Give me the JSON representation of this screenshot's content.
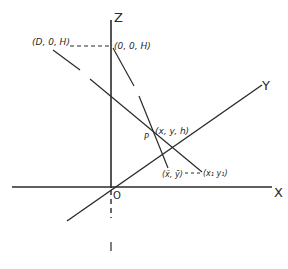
{
  "diagram": {
    "axes": {
      "z_label": "Z",
      "x_label": "X",
      "y_label": "Y",
      "origin_label": "O"
    },
    "points": {
      "light_source": "(D, 0, H)",
      "z_top": "(0, 0, H)",
      "p_coords": "(x, y, h)",
      "p_label": "P",
      "shadow_bar": "(x̄, ȳ)",
      "shadow_1": "(x₁ y₁)"
    },
    "colors": {
      "ink": "#2a2a2a",
      "background": "#ffffff"
    }
  }
}
